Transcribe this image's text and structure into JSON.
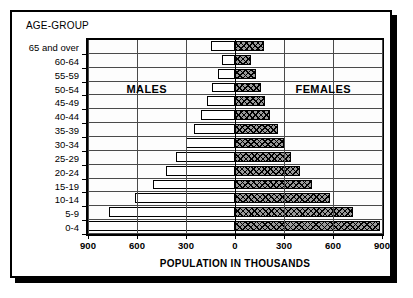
{
  "chart_data": {
    "type": "bar",
    "subtype": "population-pyramid",
    "title": "",
    "age_group_caption": "AGE-GROUP",
    "xlabel": "POPULATION IN THOUSANDS",
    "ylabel": "AGE-GROUP",
    "grid": true,
    "legend_position": "in-plot",
    "xlim": [
      -900,
      900
    ],
    "xticks": [
      -900,
      -600,
      -300,
      0,
      300,
      600,
      900
    ],
    "xtick_labels": [
      "900",
      "600",
      "300",
      "0",
      "300",
      "600",
      "900"
    ],
    "categories": [
      "65 and over",
      "60-64",
      "55-59",
      "50-54",
      "45-49",
      "40-44",
      "35-39",
      "30-34",
      "25-29",
      "20-24",
      "15-19",
      "10-14",
      "5-9",
      "0-4"
    ],
    "series": [
      {
        "name": "MALES",
        "side": "left",
        "fill": "solid-white",
        "values": [
          145,
          80,
          105,
          140,
          170,
          210,
          250,
          300,
          360,
          420,
          500,
          610,
          770,
          900
        ]
      },
      {
        "name": "FEMALES",
        "side": "right",
        "fill": "cross-hatch",
        "values": [
          175,
          95,
          130,
          160,
          185,
          215,
          265,
          300,
          340,
          400,
          470,
          580,
          720,
          890
        ]
      }
    ],
    "annotations": [
      {
        "text": "MALES",
        "x": -540,
        "row_index": 3
      },
      {
        "text": "FEMALES",
        "x": 540,
        "row_index": 3
      }
    ]
  },
  "colors": {
    "frame": "#000000",
    "grid": "#4a4a4a",
    "male_fill": "#ffffff",
    "female_fill": "#9a9a9a",
    "background": "#ffffff"
  }
}
